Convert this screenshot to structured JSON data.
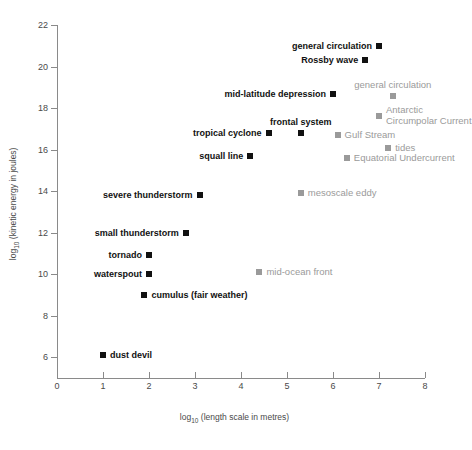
{
  "chart_data": {
    "type": "scatter",
    "title": "",
    "xlabel": "log10 (length scale in metres)",
    "ylabel": "log10 (kinetic energy in joules)",
    "xlim": [
      0,
      8
    ],
    "ylim": [
      5,
      22
    ],
    "xticks": [
      0,
      1,
      2,
      3,
      4,
      5,
      6,
      7,
      8
    ],
    "yticks": [
      6,
      8,
      10,
      12,
      14,
      16,
      18,
      20,
      22
    ],
    "grid": false,
    "legend": "none",
    "series": [
      {
        "name": "atmospheric phenomena",
        "color": "#111111",
        "points": [
          {
            "label": "general circulation",
            "x": 7.0,
            "y": 21.0,
            "label_pos": "left"
          },
          {
            "label": "Rossby wave",
            "x": 6.7,
            "y": 20.3,
            "label_pos": "left"
          },
          {
            "label": "mid-latitude depression",
            "x": 6.0,
            "y": 18.7,
            "label_pos": "left"
          },
          {
            "label": "frontal system",
            "x": 5.3,
            "y": 16.8,
            "label_pos": "above"
          },
          {
            "label": "tropical cyclone",
            "x": 4.6,
            "y": 16.8,
            "label_pos": "left"
          },
          {
            "label": "squall line",
            "x": 4.2,
            "y": 15.7,
            "label_pos": "left"
          },
          {
            "label": "severe thunderstorm",
            "x": 3.1,
            "y": 13.8,
            "label_pos": "left"
          },
          {
            "label": "small thunderstorm",
            "x": 2.8,
            "y": 12.0,
            "label_pos": "left"
          },
          {
            "label": "tornado",
            "x": 2.0,
            "y": 10.9,
            "label_pos": "left"
          },
          {
            "label": "waterspout",
            "x": 2.0,
            "y": 10.0,
            "label_pos": "left"
          },
          {
            "label": "cumulus (fair weather)",
            "x": 1.9,
            "y": 9.0,
            "label_pos": "right"
          },
          {
            "label": "dust devil",
            "x": 1.0,
            "y": 6.1,
            "label_pos": "right"
          }
        ]
      },
      {
        "name": "oceanic phenomena",
        "color": "#9a9a9a",
        "points": [
          {
            "label": "general circulation",
            "x": 7.3,
            "y": 18.6,
            "label_pos": "above"
          },
          {
            "label": "Antarctic Circumpolar Current",
            "x": 7.0,
            "y": 17.6,
            "label_pos": "right"
          },
          {
            "label": "Gulf Stream",
            "x": 6.1,
            "y": 16.7,
            "label_pos": "right"
          },
          {
            "label": "tides",
            "x": 7.2,
            "y": 16.1,
            "label_pos": "right"
          },
          {
            "label": "Equatorial Undercurrent",
            "x": 6.3,
            "y": 15.6,
            "label_pos": "right"
          },
          {
            "label": "mesoscale eddy",
            "x": 5.3,
            "y": 13.9,
            "label_pos": "right"
          },
          {
            "label": "mid-ocean front",
            "x": 4.4,
            "y": 10.1,
            "label_pos": "right"
          }
        ]
      }
    ]
  }
}
